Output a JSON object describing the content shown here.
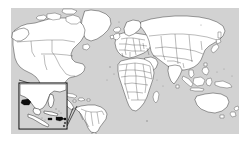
{
  "figure": {
    "kind": "world-map-with-inset",
    "projection": "equirectangular",
    "canvas": {
      "width": 252,
      "height": 149,
      "background": "#ffffff"
    },
    "map_frame": {
      "x": 11,
      "y": 8,
      "width": 228,
      "height": 126
    }
  },
  "colors": {
    "ocean": "#d2d2d2",
    "land_fill": "#ffffff",
    "coastline": "#2b2b2b",
    "country_border": "#3a3a3a",
    "highlight_fill": "#0d0d0d",
    "inset_frame": "#111111",
    "page_background": "#ffffff"
  },
  "legend": {
    "present": false,
    "items": []
  },
  "labels": {
    "title": "",
    "caption": "",
    "visible_text": []
  },
  "inset": {
    "name": "caribbean-central-america-inset",
    "box": {
      "x": 19,
      "y": 83,
      "width": 47,
      "height": 46
    },
    "region": "Gulf of Mexico, Central America and the Caribbean",
    "leader_lines": 2,
    "highlighted_areas": [
      "belize-guatemala-coast",
      "jamaica",
      "haiti-dominican-republic",
      "puerto-rico",
      "lesser-antilles"
    ]
  },
  "landmasses": [
    {
      "name": "north-america",
      "highlighted": false
    },
    {
      "name": "greenland",
      "highlighted": false
    },
    {
      "name": "south-america",
      "highlighted": false
    },
    {
      "name": "europe",
      "highlighted": false
    },
    {
      "name": "africa",
      "highlighted": false
    },
    {
      "name": "asia",
      "highlighted": false
    },
    {
      "name": "australia",
      "highlighted": false
    },
    {
      "name": "new-zealand",
      "highlighted": false
    },
    {
      "name": "indonesia",
      "highlighted": false
    },
    {
      "name": "madagascar",
      "highlighted": false
    },
    {
      "name": "japan",
      "highlighted": false
    },
    {
      "name": "philippines",
      "highlighted": false
    },
    {
      "name": "iceland",
      "highlighted": false
    },
    {
      "name": "british-isles",
      "highlighted": false
    },
    {
      "name": "sri-lanka",
      "highlighted": false
    }
  ]
}
